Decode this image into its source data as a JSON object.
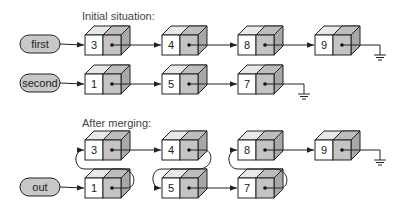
{
  "diagram": {
    "type": "linked-list-merge",
    "colors": {
      "pointer_fill": "#c4c4c4",
      "top_face_fill": "#e8e8e8",
      "side_face_fill": "#a8a8a8",
      "pill_fill": "#c8c8c8",
      "stroke": "#222222",
      "value_fill": "#ffffff"
    },
    "sections": [
      {
        "title": "Initial situation:",
        "lists": [
          {
            "label": "first",
            "values": [
              "3",
              "4",
              "8",
              "9"
            ]
          },
          {
            "label": "second",
            "values": [
              "1",
              "5",
              "7"
            ]
          }
        ]
      },
      {
        "title": "After merging:",
        "lists": [
          {
            "label": "out",
            "values": [
              "1",
              "3",
              "4",
              "5",
              "7",
              "8",
              "9"
            ]
          }
        ]
      }
    ],
    "terminator_icon": "ground-null-symbol"
  }
}
